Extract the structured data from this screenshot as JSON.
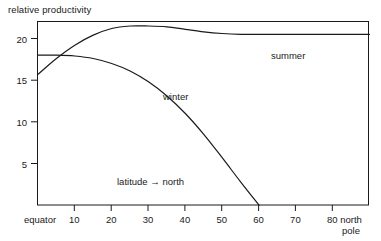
{
  "chart_data": {
    "type": "line",
    "title": "relative productivity",
    "xlabel": "latitude → north",
    "ylabel": "relative productivity",
    "xlim": [
      0,
      90
    ],
    "ylim": [
      0,
      22.2
    ],
    "grid": false,
    "legend": "inline-curve-labels",
    "x_tick_values": [
      0,
      10,
      20,
      30,
      40,
      50,
      60,
      70,
      80,
      90
    ],
    "x_tick_labels": [
      "equator",
      "10",
      "20",
      "30",
      "40",
      "50",
      "60",
      "70",
      "80",
      "north pole"
    ],
    "y_tick_values": [
      5,
      10,
      15,
      20
    ],
    "y_tick_labels": [
      "5",
      "10",
      "15",
      "20"
    ],
    "series": [
      {
        "name": "summer",
        "label": "summer",
        "color": "#1a1a1a",
        "x": [
          0,
          5,
          10,
          15,
          20,
          25,
          30,
          35,
          40,
          45,
          50,
          55,
          60,
          65,
          70,
          75,
          80,
          85,
          90
        ],
        "values": [
          15.7,
          17.6,
          19.2,
          20.4,
          21.2,
          21.5,
          21.5,
          21.4,
          21.1,
          20.8,
          20.6,
          20.5,
          20.5,
          20.5,
          20.5,
          20.5,
          20.5,
          20.5,
          20.5
        ]
      },
      {
        "name": "winter",
        "label": "winter",
        "color": "#1a1a1a",
        "x": [
          0,
          5,
          10,
          15,
          20,
          25,
          30,
          35,
          40,
          45,
          50,
          55,
          60
        ],
        "values": [
          18.0,
          18.0,
          17.9,
          17.6,
          17.0,
          16.1,
          14.8,
          13.1,
          11.0,
          8.5,
          5.7,
          2.8,
          0.0
        ]
      }
    ],
    "annotations": [
      {
        "text": "summer",
        "x": 46,
        "y": 19.3
      },
      {
        "text": "winter",
        "x": 36,
        "y": 13.6
      },
      {
        "text": "latitude → north",
        "x": 30,
        "y": 3.3
      }
    ],
    "axis_color": "#1a1a1a",
    "frame": true,
    "background": "#ffffff"
  },
  "figure": {
    "title": "relative productivity",
    "x_axis": {
      "caption": "latitude → north",
      "ticks": [
        {
          "label": "equator",
          "value": 0
        },
        {
          "label": "10",
          "value": 10
        },
        {
          "label": "20",
          "value": 20
        },
        {
          "label": "30",
          "value": 30
        },
        {
          "label": "40",
          "value": 40
        },
        {
          "label": "50",
          "value": 50
        },
        {
          "label": "60",
          "value": 60
        },
        {
          "label": "70",
          "value": 70
        },
        {
          "label": "80",
          "value": 80
        }
      ],
      "end_label_line1": "north",
      "end_label_line2": "pole"
    },
    "y_axis": {
      "ticks": [
        {
          "label": "20",
          "value": 20
        },
        {
          "label": "15",
          "value": 15
        },
        {
          "label": "10",
          "value": 10
        },
        {
          "label": "5",
          "value": 5
        }
      ]
    },
    "curves": {
      "summer_label": "summer",
      "winter_label": "winter"
    }
  }
}
